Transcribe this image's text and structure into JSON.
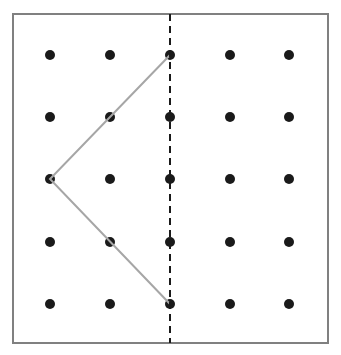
{
  "diagram": {
    "type": "dot-grid-symmetry",
    "frame": {
      "x": 13,
      "y": 14,
      "width": 315,
      "height": 329,
      "stroke": "#808080",
      "stroke_width": 2
    },
    "grid": {
      "columns_x": [
        50,
        110,
        170,
        230,
        289
      ],
      "rows_y": [
        55,
        117,
        179,
        242,
        304
      ],
      "dot_radius": 5,
      "dot_color": "#1a1a1a"
    },
    "symmetry_line": {
      "x": 170,
      "y1": 14,
      "y2": 343,
      "dash": "7,5",
      "color": "#1a1a1a",
      "width": 2
    },
    "shape_polyline": {
      "points": [
        [
          170,
          55
        ],
        [
          50,
          179
        ],
        [
          170,
          304
        ]
      ],
      "color": "#a6a6a6",
      "width": 2
    }
  }
}
